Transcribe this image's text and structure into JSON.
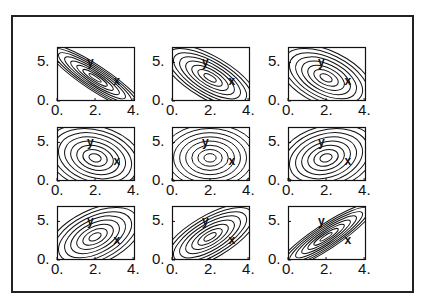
{
  "chart_data": {
    "type": "contour",
    "title": "",
    "layout": {
      "rows": 3,
      "cols": 3,
      "grid": false,
      "legend": "none"
    },
    "axes": {
      "xlim": [
        0,
        4.1
      ],
      "ylim": [
        0,
        7
      ],
      "xticks": [
        0,
        2,
        4
      ],
      "xtick_labels": [
        "0.",
        "2.",
        "4."
      ],
      "yticks": [
        0,
        5
      ],
      "ytick_labels": [
        "0.",
        "5."
      ]
    },
    "mean": [
      2.0,
      3.0
    ],
    "sigma_x": 1.0,
    "sigma_y": 1.7,
    "contour_levels": 8,
    "annotations": [
      {
        "text": "y",
        "x": 1.75,
        "y": 5.0
      },
      {
        "text": "x",
        "x": 3.15,
        "y": 2.6
      }
    ],
    "panels": [
      {
        "row": 0,
        "col": 0,
        "rho": -0.9
      },
      {
        "row": 0,
        "col": 1,
        "rho": -0.7
      },
      {
        "row": 0,
        "col": 2,
        "rho": -0.5
      },
      {
        "row": 1,
        "col": 0,
        "rho": -0.25
      },
      {
        "row": 1,
        "col": 1,
        "rho": 0.0
      },
      {
        "row": 1,
        "col": 2,
        "rho": 0.25
      },
      {
        "row": 2,
        "col": 0,
        "rho": 0.5
      },
      {
        "row": 2,
        "col": 1,
        "rho": 0.7
      },
      {
        "row": 2,
        "col": 2,
        "rho": 0.9
      }
    ]
  },
  "layout_px": {
    "col_left": [
      57,
      172,
      288
    ],
    "row_top": [
      47,
      127,
      206
    ],
    "panel_w": 78,
    "panel_h": 54
  },
  "colors": {
    "line": "#111111",
    "frame": "#222222",
    "background": "#ffffff"
  }
}
